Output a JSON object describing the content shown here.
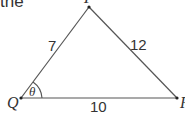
{
  "text_fragment": "the",
  "triangle": {
    "vertices": [
      {
        "name": "P",
        "label": "P"
      },
      {
        "name": "Q",
        "label": "Q"
      },
      {
        "name": "R",
        "label": "R"
      }
    ],
    "sides": {
      "PQ": "7",
      "PR": "12",
      "QR": "10"
    },
    "angle": {
      "vertex": "Q",
      "label": "θ"
    }
  },
  "colors": {
    "line": "#444444",
    "text": "#333333"
  }
}
